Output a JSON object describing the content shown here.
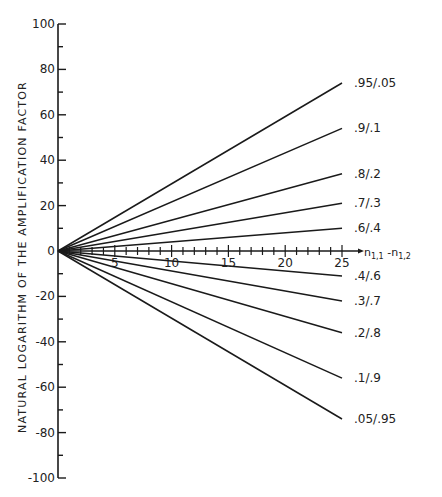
{
  "chart_data": {
    "type": "line",
    "title": "",
    "xlabel": "n1,1 - n1,2",
    "ylabel": "NATURAL LOGARITHM OF THE AMPLIFICATION FACTOR",
    "xlim": [
      0,
      25
    ],
    "ylim": [
      -100,
      100
    ],
    "x_ticks_major": [
      5,
      10,
      15,
      20,
      25
    ],
    "x_tick_minor_step": 1,
    "y_ticks_labeled": [
      100,
      80,
      60,
      40,
      20,
      0,
      -20,
      -40,
      -60,
      -80,
      -100
    ],
    "y_tick_minor_step": 10,
    "grid": false,
    "legend": "inline labels at line ends",
    "x": [
      0,
      25
    ],
    "series": [
      {
        "name": ".95/.05",
        "values": [
          0,
          74
        ]
      },
      {
        "name": ".9/.1",
        "values": [
          0,
          54
        ]
      },
      {
        "name": ".8/.2",
        "values": [
          0,
          34
        ]
      },
      {
        "name": ".7/.3",
        "values": [
          0,
          21
        ]
      },
      {
        "name": ".6/.4",
        "values": [
          0,
          10
        ]
      },
      {
        "name": ".4/.6",
        "values": [
          0,
          -11
        ]
      },
      {
        "name": ".3/.7",
        "values": [
          0,
          -22
        ]
      },
      {
        "name": ".2/.8",
        "values": [
          0,
          -36
        ]
      },
      {
        "name": ".1/.9",
        "values": [
          0,
          -56
        ]
      },
      {
        "name": ".05/.95",
        "values": [
          0,
          -74
        ]
      }
    ]
  },
  "labels": {
    "ylabel": "NATURAL LOGARITHM OF THE AMPLIFICATION FACTOR",
    "xlabel_main": "n",
    "xlabel_sub1": "1,1",
    "xlabel_dash": " -n",
    "xlabel_sub2": "1,2"
  }
}
